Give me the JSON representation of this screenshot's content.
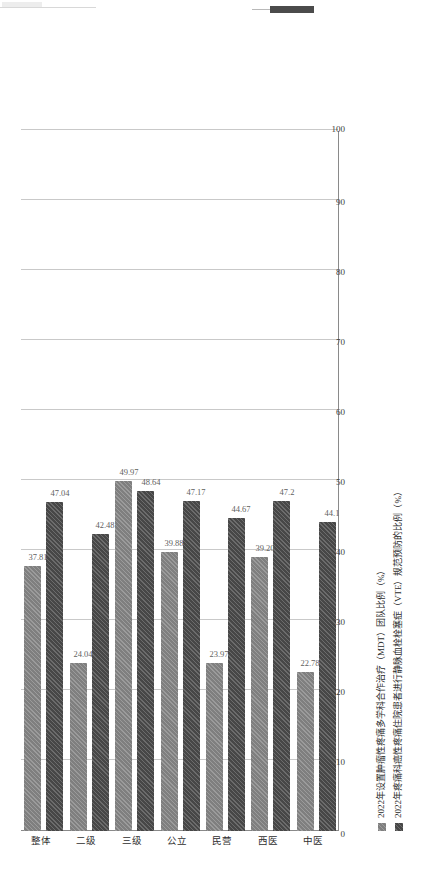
{
  "page": {
    "top_marker_color": "#4b4b4b"
  },
  "chart_data": {
    "type": "bar",
    "orientation": "horizontal-rotated",
    "title": "",
    "xlabel": "",
    "ylabel": "",
    "categories": [
      "整体",
      "二级",
      "三级",
      "公立",
      "民营",
      "西医",
      "中医"
    ],
    "series": [
      {
        "name": "2022年设置肿瘤性疼痛多学科合作治疗（MDT）团队比例（%）",
        "color": "#7f7f7f",
        "values": [
          37.81,
          24.04,
          49.97,
          39.88,
          23.97,
          39.2,
          22.78
        ],
        "labels": [
          "37.81",
          "24.04",
          "49.97",
          "39.88",
          "23.97",
          "39.20",
          "22.78"
        ]
      },
      {
        "name": "2022年疼痛科癌性疼痛住院患者进行静脉血栓栓塞症（VTE）规范预防的比例（%）",
        "color": "#474747",
        "values": [
          47.04,
          42.48,
          48.64,
          47.17,
          44.67,
          47.2,
          44.1
        ],
        "labels": [
          "47.04",
          "42.48",
          "48.64",
          "47.17",
          "44.67",
          "47.2",
          "44.1"
        ]
      }
    ],
    "xlim": [
      0,
      100
    ],
    "xticks": [
      0,
      10,
      20,
      30,
      40,
      50,
      60,
      70,
      80,
      90,
      100
    ],
    "xtick_labels": [
      "0",
      "10",
      "20",
      "30",
      "40",
      "50",
      "60",
      "70",
      "80",
      "90",
      "100"
    ],
    "grid": true,
    "legend_position": "bottom-right"
  }
}
